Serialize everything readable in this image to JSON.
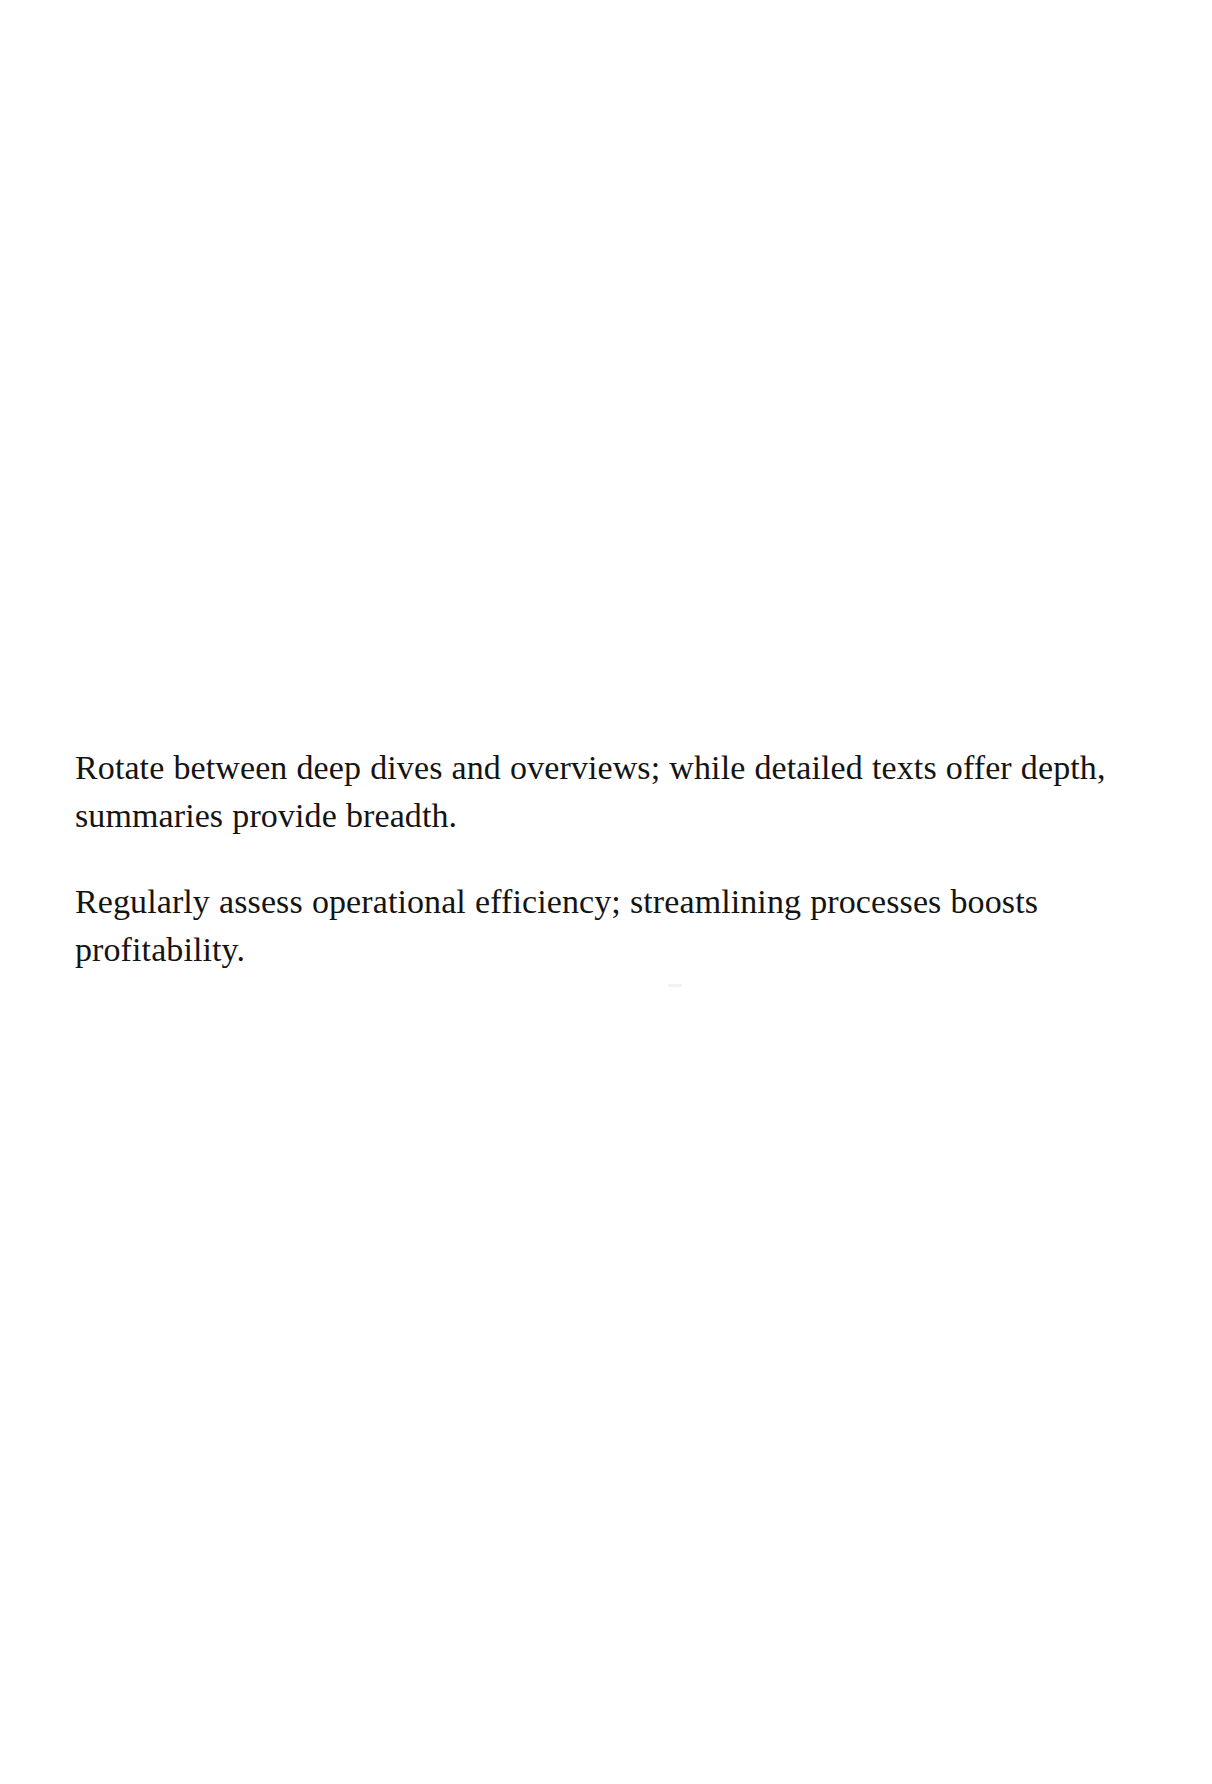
{
  "page": {
    "width": 1212,
    "height": 1784,
    "background_color": "#ffffff",
    "ink_color": "#141414"
  },
  "document": {
    "paragraphs": [
      {
        "id": "paragraph-1",
        "text": "Rotate between deep dives and overviews; while detailed texts offer depth, summaries provide breadth."
      },
      {
        "id": "paragraph-2",
        "text": "Regularly assess operational efficiency; streamlining processes boosts profitability."
      }
    ]
  }
}
